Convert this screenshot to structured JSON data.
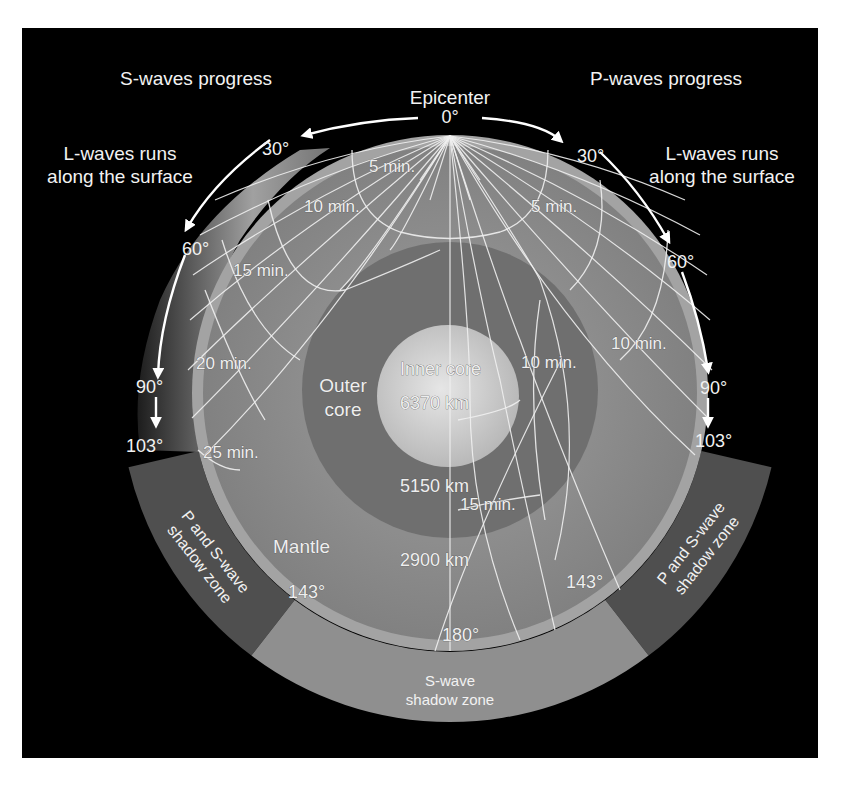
{
  "colors": {
    "background": "#ffffff",
    "panel": "#000000",
    "crust": "#9a9a9a",
    "mantle": "#8a8a8a",
    "outer_core": "#6e6e6e",
    "inner_core": "#c9c9c9",
    "ps_shadow_zone": "#4f4f4f",
    "s_shadow_zone": "#8f8f8f",
    "ray_lines": "#f0f0f0",
    "text": "#f2f2f2"
  },
  "header": {
    "s_waves_progress": "S-waves progress",
    "p_waves_progress": "P-waves progress",
    "epicenter": "Epicenter",
    "l_waves_left_line1": "L-waves runs",
    "l_waves_left_line2": "along the surface",
    "l_waves_right_line1": "L-waves runs",
    "l_waves_right_line2": "along the surface"
  },
  "degrees": {
    "top": "0°",
    "left": [
      "30°",
      "60°",
      "90°",
      "103°"
    ],
    "right": [
      "30°",
      "60°",
      "90°",
      "103°"
    ],
    "inner_left_143": "143°",
    "inner_right_143": "143°",
    "bottom_180": "180°"
  },
  "travel_times": {
    "s_wave": [
      "5 min.",
      "10 min.",
      "15 min.",
      "20 min.",
      "25 min."
    ],
    "p_wave": [
      "5 min.",
      "10 min.",
      "10 min.",
      "15 min."
    ]
  },
  "layers": {
    "inner_core_line1": "Inner core",
    "inner_core_depth": "6370 km",
    "outer_core_line1": "Outer",
    "outer_core_line2": "core",
    "outer_core_depth": "5150 km",
    "mantle": "Mantle",
    "mantle_depth": "2900 km"
  },
  "shadow_zones": {
    "left_line1": "P and S-wave",
    "left_line2": "shadow zone",
    "right_line1": "P and S-wave",
    "right_line2": "shadow zone",
    "bottom_line1": "S-wave",
    "bottom_line2": "shadow zone"
  }
}
